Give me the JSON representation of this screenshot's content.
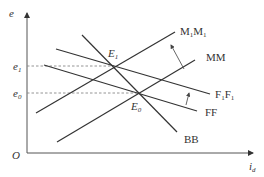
{
  "diagram": {
    "type": "economic-equilibrium-diagram",
    "axes": {
      "y": {
        "label": "e"
      },
      "x": {
        "label_main": "i",
        "label_sub": "d"
      },
      "origin": "O"
    },
    "levels": {
      "e1": {
        "main": "e",
        "sub": "1"
      },
      "e0": {
        "main": "e",
        "sub": "0"
      }
    },
    "equilibria": {
      "E1": {
        "main": "E",
        "sub": "1"
      },
      "E0": {
        "main": "E",
        "sub": "0"
      }
    },
    "curves": {
      "M1M1": {
        "part1": "M",
        "sub1": "1",
        "part2": "M",
        "sub2": "1",
        "slope": "upward",
        "color": "#333333"
      },
      "MM": {
        "label": "MM",
        "slope": "upward",
        "color": "#333333"
      },
      "F1F1": {
        "part1": "F",
        "sub1": "1",
        "part2": "F",
        "sub2": "1",
        "slope": "downward",
        "color": "#333333"
      },
      "FF": {
        "label": "FF",
        "slope": "downward",
        "color": "#333333"
      },
      "BB": {
        "label": "BB",
        "slope": "downward-steep",
        "color": "#333333"
      }
    },
    "shifts": [
      {
        "from": "MM",
        "to": "M1M1",
        "direction": "up-left"
      },
      {
        "from": "FF",
        "to": "F1F1",
        "direction": "up"
      }
    ]
  }
}
